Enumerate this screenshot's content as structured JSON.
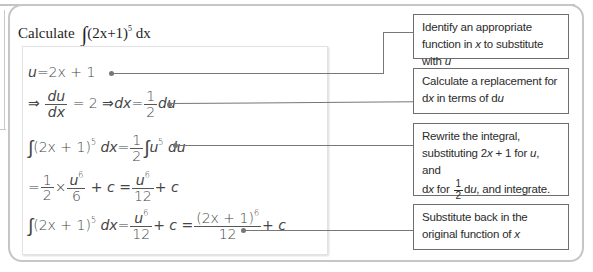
{
  "title": {
    "prefix": "Calculate",
    "integral_sign": "∫",
    "integrand": "(2x+1)",
    "exponent": "5",
    "differential": "dx"
  },
  "steps": [
    {
      "id": "step-1",
      "parts": {
        "lhs_var": "u",
        "eq": "=",
        "rhs": "2x + 1"
      }
    },
    {
      "id": "step-2",
      "parts": {
        "implies1": "⇒",
        "frac1_num": "du",
        "frac1_den": "dx",
        "eq1": "= 2",
        "implies2": "⇒",
        "dx": "dx",
        "eq2": "=",
        "frac2_num": "1",
        "frac2_den": "2",
        "du": "du"
      }
    },
    {
      "id": "step-3",
      "parts": {
        "int": "∫",
        "integrand": "(2x + 1)",
        "exp": "5",
        "dx": "dx",
        "eq": "=",
        "frac_num": "1",
        "frac_den": "2",
        "int2": "∫",
        "u": "u",
        "uexp": "5",
        "du": "du"
      }
    },
    {
      "id": "step-4",
      "parts": {
        "eq1": "=",
        "f1_num": "1",
        "f1_den": "2",
        "times": "×",
        "f2_num_base": "u",
        "f2_num_exp": "6",
        "f2_den": "6",
        "plus_c1": "+ c =",
        "f3_num_base": "u",
        "f3_num_exp": "6",
        "f3_den": "12",
        "plus_c2": "+ c"
      }
    },
    {
      "id": "step-5",
      "parts": {
        "int": "∫",
        "integrand": "(2x + 1)",
        "exp": "5",
        "dx": "dx",
        "eq": "=",
        "f1_num_base": "u",
        "f1_num_exp": "6",
        "f1_den": "12",
        "plus_c1": "+ c =",
        "f2_num_base": "(2x + 1)",
        "f2_num_exp": "6",
        "f2_den": "12",
        "plus_c2": "+ c"
      }
    }
  ],
  "notes": [
    {
      "id": "note-1",
      "text_a": "Identify an appropriate function in ",
      "var_x": "x",
      "text_b": " to substitute with ",
      "var_u": "u"
    },
    {
      "id": "note-2",
      "text_a": "Calculate a replacement for d",
      "var_x": "x",
      "text_b": " in terms of d",
      "var_u": "u"
    },
    {
      "id": "note-3",
      "line1": "Rewrite the integral,",
      "line2_a": "substituting 2",
      "line2_x": "x",
      "line2_b": " + 1 for ",
      "line2_u": "u",
      "line2_c": ", and",
      "line3_a": "d",
      "line3_x": "x",
      "line3_b": " for ",
      "frac_num": "1",
      "frac_den": "2",
      "line3_c": "d",
      "line3_u": "u",
      "line3_d": ", and integrate."
    },
    {
      "id": "note-4",
      "text_a": "Substitute back in the original function of ",
      "var_x": "x"
    }
  ],
  "colors": {
    "frame_border": "#c6c6c6",
    "note_border": "#6e6e6e",
    "connector": "#777777",
    "text": "#2b2b2b"
  }
}
